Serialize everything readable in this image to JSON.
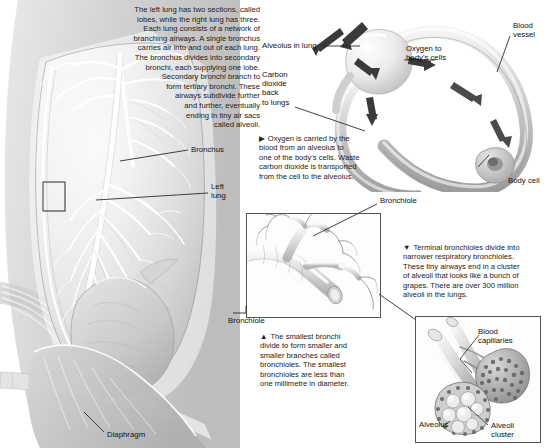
{
  "figure": {
    "background_color": "#ffffff",
    "line_color": "#2b2b2b"
  },
  "intro_text": {
    "lines": [
      "The left lung has two sections, called",
      "lobes, while the right lung has three.",
      "Each lung consists of a network of",
      "branching airways. A single bronchus",
      "carries air into and out of each lung.",
      "The bronchus divides into secondary",
      "bronchi, each supplying one lobe.",
      "Secondary bronchi branch to",
      "form tertiary bronchi. These",
      "airways subdivide further",
      "and further, eventually",
      "ending in tiny air sacs",
      "called alveoli."
    ]
  },
  "lung_panel": {
    "labels": {
      "bronchus": "Bronchus",
      "left_lung_line1": "Left",
      "left_lung_line2": "lung",
      "diaphragm": "Diaphragm"
    }
  },
  "gas_exchange_panel": {
    "labels": {
      "alveolus_in_lung": "Alveolus in lung",
      "blood_vessel_line1": "Blood",
      "blood_vessel_line2": "vessel",
      "oxygen_to_cells_line1": "Oxygen to",
      "oxygen_to_cells_line2": "body's cells",
      "carbon_dioxide_line1": "Carbon",
      "carbon_dioxide_line2": "dioxide",
      "carbon_dioxide_line3": "back",
      "carbon_dioxide_line4": "to lungs",
      "body_cell": "Body cell"
    },
    "caption": {
      "marker": "▶",
      "lines": [
        "Oxygen is carried by the",
        "blood from an alveolus to",
        "one of the body's cells. Waste",
        "carbon dioxide is transported",
        "from the cell to the alveolus."
      ]
    }
  },
  "bronchiole_panel": {
    "label_top": "Bronchiole",
    "label_bottom": "Bronchiole",
    "caption": {
      "marker": "▲",
      "lines": [
        "The smallest bronchi",
        "divide to form smaller and",
        "smaller branches called",
        "bronchioles. The smallest",
        "bronchioles are less than",
        "one millimetre in diameter."
      ]
    }
  },
  "alveoli_panel": {
    "caption": {
      "marker": "▼",
      "lines": [
        "Terminal bronchioles divide into",
        "narrower respiratory bronchioles.",
        "These tiny airways end in a cluster",
        "of alveoli that looks like a bunch of",
        "grapes. There are over 300 million",
        "alveoli in the lungs."
      ]
    },
    "labels": {
      "blood_capillaries_line1": "Blood",
      "blood_capillaries_line2": "capillaries",
      "alveolus": "Alveolus",
      "alveoli_cluster_line1": "Alveoli",
      "alveoli_cluster_line2": "cluster"
    }
  }
}
